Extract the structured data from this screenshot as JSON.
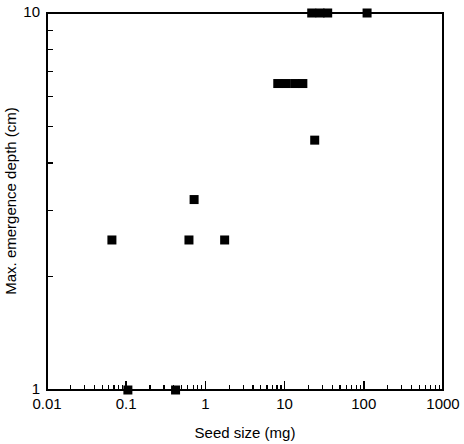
{
  "chart_data": {
    "type": "scatter",
    "title": "",
    "xlabel": "Seed size (mg)",
    "ylabel": "Max. emergence depth (cm)",
    "xscale": "log",
    "yscale": "log",
    "xlim": [
      0.01,
      1000
    ],
    "ylim": [
      1,
      10
    ],
    "grid": false,
    "legend": null,
    "marker": {
      "shape": "square",
      "color": "#000000",
      "size_px": 9
    },
    "xticks_major": [
      {
        "value": 0.01,
        "label": "0.01"
      },
      {
        "value": 0.1,
        "label": "0.1"
      },
      {
        "value": 1,
        "label": "1"
      },
      {
        "value": 10,
        "label": "10"
      },
      {
        "value": 100,
        "label": "100"
      },
      {
        "value": 1000,
        "label": "1000"
      }
    ],
    "xticks_minor": [
      0.02,
      0.03,
      0.04,
      0.05,
      0.06,
      0.07,
      0.08,
      0.09,
      0.2,
      0.3,
      0.4,
      0.5,
      0.6,
      0.7,
      0.8,
      0.9,
      2,
      3,
      4,
      5,
      6,
      7,
      8,
      9,
      20,
      30,
      40,
      50,
      60,
      70,
      80,
      90,
      200,
      300,
      400,
      500,
      600,
      700,
      800,
      900
    ],
    "yticks_major": [
      {
        "value": 1,
        "label": "1"
      },
      {
        "value": 10,
        "label": "10"
      }
    ],
    "yticks_minor": [
      2,
      3,
      4,
      5,
      6,
      7,
      8,
      9
    ],
    "points": [
      {
        "x": 0.066,
        "y": 2.5
      },
      {
        "x": 0.105,
        "y": 1.0
      },
      {
        "x": 0.42,
        "y": 1.0
      },
      {
        "x": 0.62,
        "y": 2.5
      },
      {
        "x": 0.72,
        "y": 3.2
      },
      {
        "x": 1.75,
        "y": 2.5
      },
      {
        "x": 8.2,
        "y": 6.5
      },
      {
        "x": 10.5,
        "y": 6.5
      },
      {
        "x": 13.5,
        "y": 6.5
      },
      {
        "x": 17.0,
        "y": 6.5
      },
      {
        "x": 24.0,
        "y": 4.6
      },
      {
        "x": 22.0,
        "y": 10.0
      },
      {
        "x": 28.0,
        "y": 10.0
      },
      {
        "x": 35.0,
        "y": 10.0
      },
      {
        "x": 110.0,
        "y": 10.0
      }
    ]
  },
  "axes_geometry": {
    "left_px": 47,
    "right_px": 443,
    "top_px": 13,
    "bottom_px": 390
  }
}
